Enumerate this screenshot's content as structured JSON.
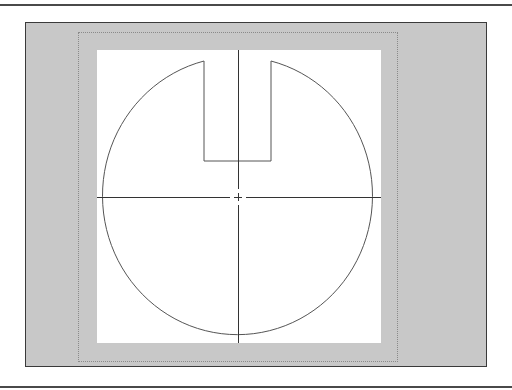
{
  "view": {
    "type": "print-preview",
    "colors": {
      "rule": "#4a4a4a",
      "canvas_bg": "#c8c8c8",
      "paper_bg": "#ffffff",
      "page_outline": "#8a8a8a",
      "stroke": "#555555"
    }
  },
  "drawing": {
    "shape": "circle-with-slot",
    "center": [
      238,
      197
    ],
    "radius_x": 135,
    "radius_y": 139,
    "slot": {
      "left": 204,
      "right": 271,
      "top": 61,
      "bottom": 161
    },
    "centerlines": {
      "horizontal_y": 197,
      "vertical_x": 238
    }
  }
}
